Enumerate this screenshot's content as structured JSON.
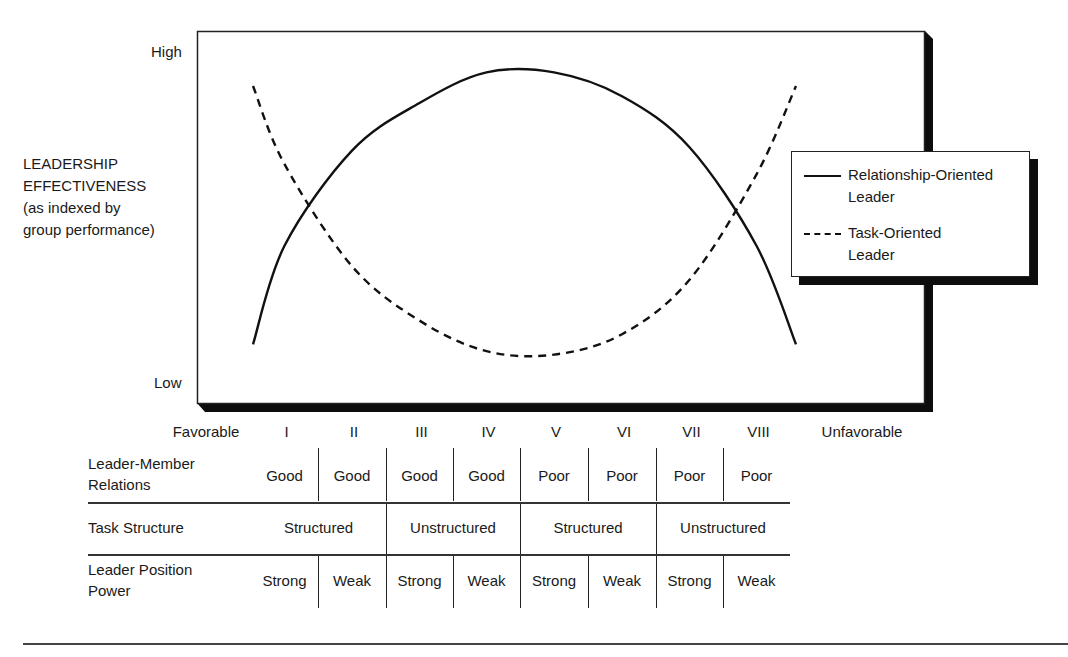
{
  "y_axis": {
    "title_lines": [
      "LEADERSHIP",
      "EFFECTIVENESS",
      "(as indexed by",
      "group performance)"
    ],
    "high_label": "High",
    "low_label": "Low"
  },
  "x_axis": {
    "left_label": "Favorable",
    "right_label": "Unfavorable",
    "octants": [
      "I",
      "II",
      "III",
      "IV",
      "V",
      "VI",
      "VII",
      "VIII"
    ]
  },
  "legend": {
    "items": [
      {
        "style": "solid",
        "lines": [
          "Relationship-Oriented",
          "Leader"
        ]
      },
      {
        "style": "dashed",
        "lines": [
          "Task-Oriented",
          "Leader"
        ]
      }
    ]
  },
  "table": {
    "rows": [
      {
        "label_lines": [
          "Leader-Member",
          "Relations"
        ],
        "cells": [
          {
            "text": "Good",
            "span": 1
          },
          {
            "text": "Good",
            "span": 1
          },
          {
            "text": "Good",
            "span": 1
          },
          {
            "text": "Good",
            "span": 1
          },
          {
            "text": "Poor",
            "span": 1
          },
          {
            "text": "Poor",
            "span": 1
          },
          {
            "text": "Poor",
            "span": 1
          },
          {
            "text": "Poor",
            "span": 1
          }
        ]
      },
      {
        "label_lines": [
          "Task Structure"
        ],
        "cells": [
          {
            "text": "Structured",
            "span": 2
          },
          {
            "text": "Unstructured",
            "span": 2
          },
          {
            "text": "Structured",
            "span": 2
          },
          {
            "text": "Unstructured",
            "span": 2
          }
        ]
      },
      {
        "label_lines": [
          "Leader Position",
          "Power"
        ],
        "cells": [
          {
            "text": "Strong",
            "span": 1
          },
          {
            "text": "Weak",
            "span": 1
          },
          {
            "text": "Strong",
            "span": 1
          },
          {
            "text": "Weak",
            "span": 1
          },
          {
            "text": "Strong",
            "span": 1
          },
          {
            "text": "Weak",
            "span": 1
          },
          {
            "text": "Strong",
            "span": 1
          },
          {
            "text": "Weak",
            "span": 1
          }
        ]
      }
    ]
  },
  "chart_data": {
    "type": "line",
    "title": "",
    "xlabel": "Situational favorableness (Favorable → Unfavorable)",
    "ylabel": "LEADERSHIP EFFECTIVENESS (as indexed by group performance)",
    "categories": [
      "I",
      "II",
      "III",
      "IV",
      "V",
      "VI",
      "VII",
      "VIII"
    ],
    "ylim": [
      0,
      100
    ],
    "y_ticks": [
      "Low",
      "High"
    ],
    "grid": false,
    "legend_position": "right",
    "series": [
      {
        "name": "Relationship-Oriented Leader",
        "style": "solid",
        "values": [
          43,
          71,
          85,
          94,
          94,
          87,
          72,
          43
        ]
      },
      {
        "name": "Task-Oriented Leader",
        "style": "dashed",
        "values": [
          67,
          37,
          21,
          12,
          11,
          17,
          33,
          64
        ]
      }
    ]
  }
}
